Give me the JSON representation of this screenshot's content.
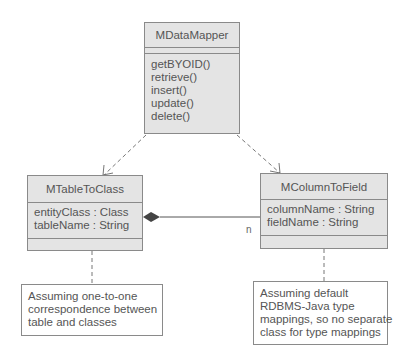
{
  "classes": {
    "data_mapper": {
      "name": "MDataMapper",
      "attributes": [],
      "operations": [
        "getBYOID()",
        "retrieve()",
        "insert()",
        "update()",
        "delete()"
      ]
    },
    "table_to_class": {
      "name": "MTableToClass",
      "attributes": [
        "entityClass : Class",
        "tableName : String"
      ],
      "operations": []
    },
    "column_to_field": {
      "name": "MColumnToField",
      "attributes": [
        "columnName : String",
        "fieldName : String"
      ],
      "operations": []
    }
  },
  "relationships": {
    "composition": {
      "from": "MTableToClass",
      "to": "MColumnToField",
      "multiplicity": "n"
    },
    "dependencies": [
      {
        "from": "MDataMapper",
        "to": "MTableToClass"
      },
      {
        "from": "MDataMapper",
        "to": "MColumnToField"
      }
    ]
  },
  "notes": {
    "table_note": {
      "lines": [
        "Assuming one-to-one",
        "correspondence between",
        "table and classes"
      ]
    },
    "column_note": {
      "lines": [
        "Assuming default",
        "RDBMS-Java type",
        "mappings, so no separate",
        "class for type mappings"
      ]
    }
  },
  "colors": {
    "class_fill": "#e4e4e4",
    "border": "#8a8a8a",
    "text": "#555555"
  }
}
